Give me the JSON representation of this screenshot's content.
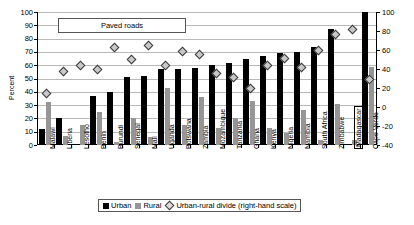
{
  "chart_data": {
    "type": "bar",
    "title": "Paved roads",
    "ylabel": "Percent",
    "ylim": [
      0,
      100
    ],
    "y2lim": [
      -40,
      100
    ],
    "yticks": [
      100,
      90,
      80,
      70,
      60,
      50,
      40,
      30,
      20,
      10,
      0
    ],
    "y2ticks": [
      100,
      80,
      60,
      40,
      20,
      0,
      -20,
      -40
    ],
    "grid": true,
    "legend_position": "bottom",
    "categories": [
      "Malawi",
      "Liberia",
      "Lesotho",
      "Benin",
      "Burundi",
      "Senegal",
      "Mali",
      "Uganda",
      "Botswana",
      "Zambia",
      "Mozambique",
      "Tanzania",
      "Ghana",
      "Kenya",
      "Nigeria",
      "Namibia",
      "South Africa",
      "Zimbabwe",
      "Madagascar",
      "Cape Verde"
    ],
    "highlighted_category": "Madagascar",
    "series": [
      {
        "name": "Urban",
        "axis": "left",
        "color": "#000000",
        "values": [
          12,
          20,
          0,
          37,
          40,
          51,
          52,
          57,
          57,
          58,
          60,
          62,
          65,
          67,
          69,
          70,
          74,
          87,
          0,
          100
        ]
      },
      {
        "name": "Rural",
        "axis": "left",
        "color": "#969696",
        "values": [
          32,
          7,
          15,
          25,
          2,
          20,
          6,
          43,
          15,
          36,
          13,
          20,
          33,
          13,
          9,
          26,
          4,
          31,
          4,
          59
        ]
      },
      {
        "name": "Urban-rural divide (right-hand scale)",
        "axis": "right",
        "color": "#c8c8c8",
        "values": [
          15,
          38,
          44,
          40,
          63,
          51,
          65,
          44,
          59,
          56,
          36,
          32,
          20,
          44,
          52,
          42,
          60,
          77,
          82,
          30
        ]
      }
    ]
  },
  "legend": {
    "urban_label": "Urban",
    "rural_label": "Rural",
    "divide_label": "Urban-rural divide (right-hand scale)"
  }
}
